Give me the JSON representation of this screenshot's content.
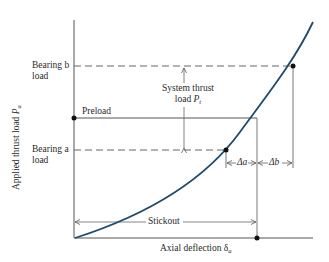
{
  "diagram": {
    "axes": {
      "y_label": "Applied thrust load",
      "y_symbol": "P",
      "y_subscript": "a",
      "x_label": "Axial deflection",
      "x_symbol": "δ",
      "x_subscript": "a"
    },
    "labels": {
      "bearing_b_line1": "Bearing b",
      "bearing_b_line2": "load",
      "bearing_a_line1": "Bearing a",
      "bearing_a_line2": "load",
      "preload": "Preload",
      "system_thrust_line1": "System thrust",
      "system_thrust_line2": "load",
      "system_thrust_symbol": "P",
      "system_thrust_subscript": "t",
      "delta_a": "Δa",
      "delta_b": "Δb",
      "stickout": "Stickout"
    },
    "colors": {
      "curve": "#1f4a6b",
      "lines": "#555555",
      "text": "#2a2a2a",
      "points": "#111111"
    }
  }
}
